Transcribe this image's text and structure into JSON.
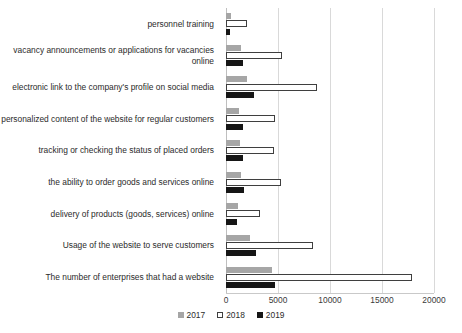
{
  "chart_data": {
    "type": "bar",
    "orientation": "horizontal",
    "title": "",
    "xlabel": "",
    "ylabel": "",
    "xlim": [
      0,
      20000
    ],
    "xticks": [
      0,
      5000,
      10000,
      15000,
      20000
    ],
    "xtick_labels": [
      "0",
      "5000",
      "10000",
      "15000",
      "20000"
    ],
    "grid": true,
    "legend_position": "bottom-center",
    "categories": [
      "personnel training",
      "vacancy announcements or applications for vacancies online",
      "electronic link to the company's profile on social media",
      "personalized content of the website for regular customers",
      "tracking or checking the status of placed orders",
      "the ability to order goods and services online",
      "delivery of products (goods, services) online",
      "Usage of the website to serve customers",
      "The number of enterprises that had a website"
    ],
    "series": [
      {
        "name": "2017",
        "color": "#a6a6a6",
        "values": [
          500,
          1450,
          2000,
          1250,
          1350,
          1450,
          1150,
          2300,
          4400
        ]
      },
      {
        "name": "2018",
        "color": "#ffffff",
        "values": [
          2000,
          5400,
          8750,
          4700,
          4600,
          5300,
          3250,
          8350,
          17900
        ]
      },
      {
        "name": "2019",
        "color": "#161616",
        "values": [
          400,
          1650,
          2700,
          1650,
          1650,
          1750,
          1050,
          2900,
          4700
        ]
      }
    ]
  },
  "legend": {
    "items": [
      {
        "label": "2017"
      },
      {
        "label": "2018"
      },
      {
        "label": "2019"
      }
    ]
  }
}
